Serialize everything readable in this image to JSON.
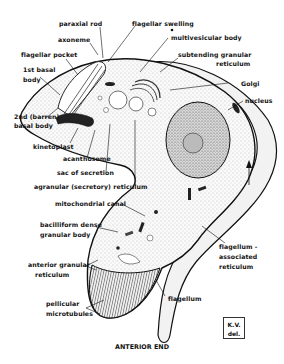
{
  "diagram": {
    "orientation_label": "ANTERIOR END",
    "signature": {
      "line1": "K.V.",
      "line2": "del."
    },
    "labels": [
      {
        "id": "paraxial-rod",
        "text": "paraxial rod"
      },
      {
        "id": "flagellar-swelling",
        "text": "flagellar swelling"
      },
      {
        "id": "axoneme",
        "text": "axoneme"
      },
      {
        "id": "multivesicular-body",
        "text": "multivesicular body"
      },
      {
        "id": "flagellar-pocket",
        "text": "flagellar pocket"
      },
      {
        "id": "subtending-granular-reticulum-1",
        "text": "subtending granular"
      },
      {
        "id": "subtending-granular-reticulum-2",
        "text": "reticulum"
      },
      {
        "id": "first-basal-body-1",
        "text": "1st basal"
      },
      {
        "id": "first-basal-body-2",
        "text": "body"
      },
      {
        "id": "golgi",
        "text": "Golgi"
      },
      {
        "id": "nucleus",
        "text": "nucleus"
      },
      {
        "id": "second-basal-body-1",
        "text": "2nd (barren)"
      },
      {
        "id": "second-basal-body-2",
        "text": "basal body"
      },
      {
        "id": "kinetoplast",
        "text": "kinetoplast"
      },
      {
        "id": "acanthosome",
        "text": "acanthosome"
      },
      {
        "id": "sac-of-secretion",
        "text": "sac of secretion"
      },
      {
        "id": "agranular-reticulum",
        "text": "agranular (secretory) reticulum"
      },
      {
        "id": "mitochondrial-canal",
        "text": "mitochondrial canal"
      },
      {
        "id": "bacilliform-1",
        "text": "bacilliform dense"
      },
      {
        "id": "bacilliform-2",
        "text": "granular body"
      },
      {
        "id": "flagellum-assoc-1",
        "text": "flagellum -"
      },
      {
        "id": "flagellum-assoc-2",
        "text": "associated"
      },
      {
        "id": "flagellum-assoc-3",
        "text": "reticulum"
      },
      {
        "id": "anterior-granular-1",
        "text": "anterior granular"
      },
      {
        "id": "anterior-granular-2",
        "text": "reticulum"
      },
      {
        "id": "pellicular-1",
        "text": "pellicular"
      },
      {
        "id": "pellicular-2",
        "text": "microtubules"
      },
      {
        "id": "flagellum",
        "text": "flagellum"
      }
    ],
    "colors": {
      "ink": "#111111",
      "stipple": "#9a9a9a",
      "background": "#ffffff",
      "membrane_fill": "#efefef"
    }
  }
}
